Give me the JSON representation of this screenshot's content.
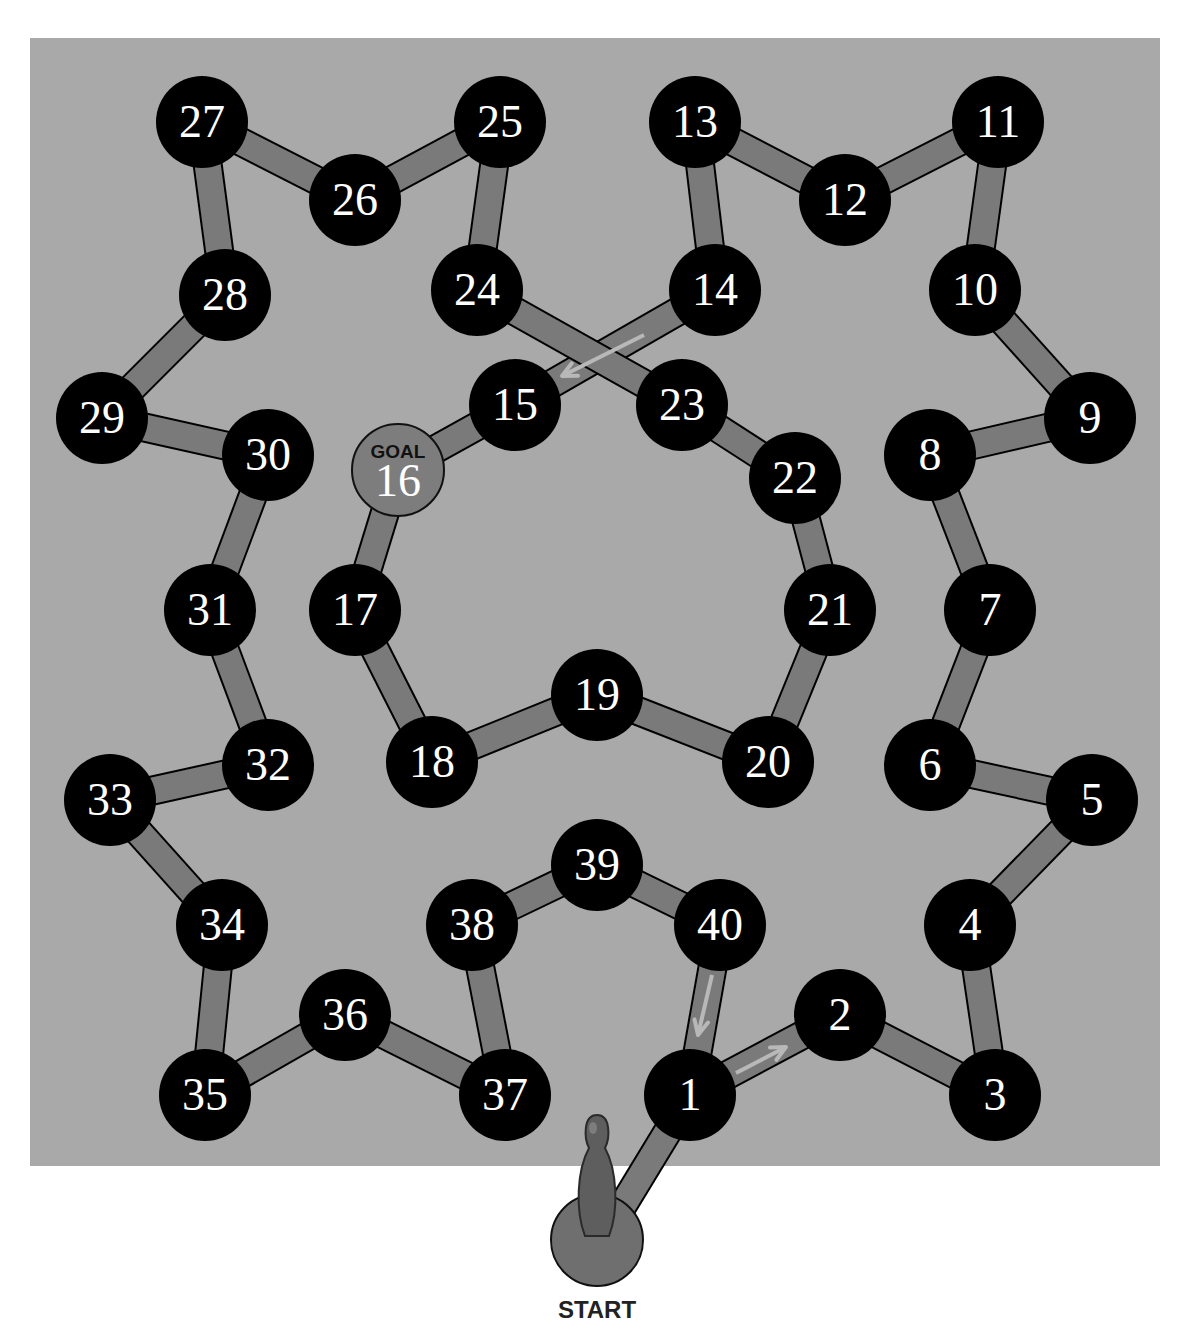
{
  "board": {
    "background": "#a9a9a9",
    "path_color": "#7a7a7a",
    "node_color": "#000000",
    "goal_color": "#7d7d7d",
    "arrow_color": "#b8b8b8",
    "node_radius": 46,
    "rect": {
      "x": 30,
      "y": 38,
      "w": 1130,
      "h": 1128
    }
  },
  "start": {
    "label": "START",
    "x": 597,
    "y": 1240,
    "r": 46,
    "icon": "bowling-pin-token"
  },
  "goal": {
    "tag": "GOAL",
    "number": "16"
  },
  "nodes": [
    {
      "n": "1",
      "x": 690,
      "y": 1095
    },
    {
      "n": "2",
      "x": 840,
      "y": 1015
    },
    {
      "n": "3",
      "x": 995,
      "y": 1095
    },
    {
      "n": "4",
      "x": 970,
      "y": 925
    },
    {
      "n": "5",
      "x": 1092,
      "y": 800
    },
    {
      "n": "6",
      "x": 930,
      "y": 765
    },
    {
      "n": "7",
      "x": 990,
      "y": 610
    },
    {
      "n": "8",
      "x": 930,
      "y": 455
    },
    {
      "n": "9",
      "x": 1090,
      "y": 418
    },
    {
      "n": "10",
      "x": 975,
      "y": 290
    },
    {
      "n": "11",
      "x": 998,
      "y": 122
    },
    {
      "n": "12",
      "x": 845,
      "y": 200
    },
    {
      "n": "13",
      "x": 695,
      "y": 122
    },
    {
      "n": "14",
      "x": 715,
      "y": 290
    },
    {
      "n": "15",
      "x": 515,
      "y": 405
    },
    {
      "n": "16",
      "x": 398,
      "y": 470,
      "goal": true
    },
    {
      "n": "17",
      "x": 355,
      "y": 610
    },
    {
      "n": "18",
      "x": 432,
      "y": 762
    },
    {
      "n": "19",
      "x": 597,
      "y": 695
    },
    {
      "n": "20",
      "x": 768,
      "y": 762
    },
    {
      "n": "21",
      "x": 830,
      "y": 610
    },
    {
      "n": "22",
      "x": 795,
      "y": 478
    },
    {
      "n": "23",
      "x": 682,
      "y": 405
    },
    {
      "n": "24",
      "x": 477,
      "y": 290
    },
    {
      "n": "25",
      "x": 500,
      "y": 122
    },
    {
      "n": "26",
      "x": 355,
      "y": 200
    },
    {
      "n": "27",
      "x": 202,
      "y": 122
    },
    {
      "n": "28",
      "x": 225,
      "y": 295
    },
    {
      "n": "29",
      "x": 102,
      "y": 418
    },
    {
      "n": "30",
      "x": 268,
      "y": 455
    },
    {
      "n": "31",
      "x": 210,
      "y": 610
    },
    {
      "n": "32",
      "x": 268,
      "y": 765
    },
    {
      "n": "33",
      "x": 110,
      "y": 800
    },
    {
      "n": "34",
      "x": 222,
      "y": 925
    },
    {
      "n": "35",
      "x": 205,
      "y": 1095
    },
    {
      "n": "36",
      "x": 345,
      "y": 1015
    },
    {
      "n": "37",
      "x": 505,
      "y": 1095
    },
    {
      "n": "38",
      "x": 472,
      "y": 925
    },
    {
      "n": "39",
      "x": 597,
      "y": 865
    },
    {
      "n": "40",
      "x": 720,
      "y": 925
    }
  ],
  "arrows": [
    {
      "from": "40",
      "to": "1",
      "x1": 712,
      "y1": 975,
      "x2": 698,
      "y2": 1035
    },
    {
      "from": "1",
      "to": "2",
      "x1": 736,
      "y1": 1073,
      "x2": 786,
      "y2": 1047
    },
    {
      "from": "14",
      "to": "15",
      "x1": 644,
      "y1": 335,
      "x2": 562,
      "y2": 376
    }
  ]
}
